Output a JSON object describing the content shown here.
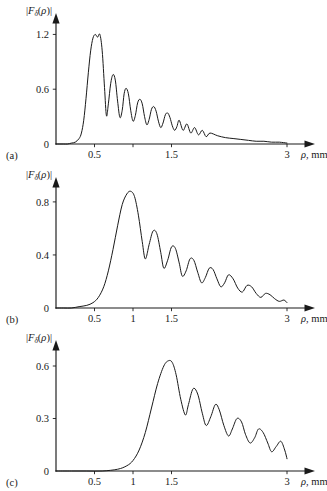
{
  "figure": {
    "background_color": "#ffffff",
    "line_color": "#1a1a1a",
    "panel_count": 3
  },
  "chart_data": [
    {
      "type": "line",
      "panel_tag": "(a)",
      "title": "",
      "ylabel": "|Fδ(ρ)|",
      "xlabel": "ρ, mm",
      "xlabel_symbol": "ρ",
      "xlabel_unit": ", mm",
      "ylabel_parts": {
        "bar_open": "|",
        "F": "F",
        "subscript": "δ",
        "arg_open": "(",
        "rho": "ρ",
        "arg_close": ")",
        "bar_close": "|"
      },
      "xlim": [
        0,
        3.25
      ],
      "ylim": [
        0,
        1.38
      ],
      "grid": false,
      "legend": "none",
      "xticks": [
        0.5,
        1,
        1.5,
        3
      ],
      "xtick_labels": [
        "0.5",
        "1.5",
        "3"
      ],
      "xtick_label_values": [
        0.5,
        1.5,
        3
      ],
      "yticks": [
        0,
        0.6,
        1.2
      ],
      "ytick_labels": [
        "0",
        "0.6",
        "1.2"
      ],
      "onset": 0.35,
      "main_peak_x": 0.57,
      "main_peak_y": 1.2,
      "oscillation_period": 0.115,
      "envelope_decay": 2.2,
      "x": [
        0.0,
        0.05,
        0.1,
        0.15,
        0.2,
        0.25,
        0.3,
        0.33,
        0.36,
        0.39,
        0.42,
        0.45,
        0.48,
        0.51,
        0.54,
        0.57,
        0.6,
        0.63,
        0.655,
        0.68,
        0.71,
        0.74,
        0.77,
        0.8,
        0.83,
        0.86,
        0.885,
        0.91,
        0.94,
        0.97,
        1.0,
        1.03,
        1.06,
        1.09,
        1.12,
        1.15,
        1.18,
        1.21,
        1.24,
        1.27,
        1.3,
        1.33,
        1.36,
        1.39,
        1.42,
        1.45,
        1.48,
        1.51,
        1.54,
        1.57,
        1.6,
        1.65,
        1.7,
        1.75,
        1.8,
        1.85,
        1.9,
        1.95,
        2.0,
        2.1,
        2.2,
        2.3,
        2.4,
        2.5,
        2.6,
        2.7,
        2.8,
        2.9,
        3.0
      ],
      "y": [
        0.0,
        0.0,
        0.0,
        0.0,
        0.01,
        0.02,
        0.06,
        0.12,
        0.26,
        0.5,
        0.78,
        1.02,
        1.16,
        1.2,
        1.17,
        1.2,
        1.02,
        0.62,
        0.31,
        0.44,
        0.66,
        0.76,
        0.7,
        0.47,
        0.29,
        0.37,
        0.55,
        0.61,
        0.55,
        0.37,
        0.25,
        0.31,
        0.45,
        0.49,
        0.44,
        0.3,
        0.21,
        0.27,
        0.38,
        0.41,
        0.36,
        0.25,
        0.18,
        0.23,
        0.32,
        0.34,
        0.29,
        0.2,
        0.15,
        0.19,
        0.26,
        0.15,
        0.22,
        0.12,
        0.18,
        0.1,
        0.15,
        0.08,
        0.12,
        0.09,
        0.07,
        0.06,
        0.05,
        0.04,
        0.03,
        0.03,
        0.02,
        0.02,
        0.01
      ]
    },
    {
      "type": "line",
      "panel_tag": "(b)",
      "title": "",
      "ylabel": "|Fδ(ρ)|",
      "xlabel": "ρ, mm",
      "xlabel_symbol": "ρ",
      "xlabel_unit": ", mm",
      "ylabel_parts": {
        "bar_open": "|",
        "F": "F",
        "subscript": "δ",
        "arg_open": "(",
        "rho": "ρ",
        "arg_close": ")",
        "bar_close": "|"
      },
      "xlim": [
        0,
        3.25
      ],
      "ylim": [
        0,
        0.95
      ],
      "grid": false,
      "legend": "none",
      "xticks": [
        0.5,
        1,
        1.5,
        3
      ],
      "xtick_labels": [
        "0.5",
        "1",
        "1.5",
        "3"
      ],
      "xtick_label_values": [
        0.5,
        1,
        1.5,
        3
      ],
      "yticks": [
        0,
        0.4,
        0.8
      ],
      "ytick_labels": [
        "0",
        "0.4",
        "0.8"
      ],
      "onset": 0.55,
      "main_peak_x": 0.97,
      "main_peak_y": 0.88,
      "oscillation_period": 0.15,
      "envelope_decay": 1.6,
      "x": [
        0.0,
        0.1,
        0.2,
        0.3,
        0.4,
        0.48,
        0.55,
        0.62,
        0.68,
        0.74,
        0.8,
        0.86,
        0.92,
        0.97,
        1.02,
        1.07,
        1.12,
        1.16,
        1.21,
        1.26,
        1.31,
        1.36,
        1.4,
        1.45,
        1.5,
        1.55,
        1.6,
        1.64,
        1.69,
        1.74,
        1.79,
        1.84,
        1.89,
        1.94,
        1.99,
        2.04,
        2.09,
        2.14,
        2.19,
        2.24,
        2.3,
        2.36,
        2.42,
        2.48,
        2.54,
        2.6,
        2.66,
        2.72,
        2.78,
        2.84,
        2.9,
        2.96,
        3.0
      ],
      "y": [
        0.0,
        0.0,
        0.0,
        0.01,
        0.02,
        0.04,
        0.08,
        0.16,
        0.28,
        0.44,
        0.62,
        0.78,
        0.86,
        0.88,
        0.84,
        0.7,
        0.5,
        0.37,
        0.48,
        0.58,
        0.56,
        0.42,
        0.3,
        0.36,
        0.46,
        0.45,
        0.34,
        0.24,
        0.28,
        0.37,
        0.36,
        0.27,
        0.19,
        0.23,
        0.3,
        0.29,
        0.22,
        0.16,
        0.19,
        0.25,
        0.22,
        0.15,
        0.12,
        0.17,
        0.16,
        0.11,
        0.08,
        0.11,
        0.1,
        0.07,
        0.05,
        0.06,
        0.04
      ]
    },
    {
      "type": "line",
      "panel_tag": "(c)",
      "title": "",
      "ylabel": "|Fδ(ρ)|",
      "xlabel": "ρ, mm",
      "xlabel_symbol": "ρ",
      "xlabel_unit": ", mm",
      "ylabel_parts": {
        "bar_open": "|",
        "F": "F",
        "subscript": "δ",
        "arg_open": "(",
        "rho": "ρ",
        "arg_close": ")",
        "bar_close": "|"
      },
      "xlim": [
        0,
        3.25
      ],
      "ylim": [
        0,
        0.72
      ],
      "grid": false,
      "legend": "none",
      "xticks": [
        0.5,
        1,
        1.5,
        3
      ],
      "xtick_labels": [
        "0.5",
        "1",
        "1.5",
        "3"
      ],
      "xtick_label_values": [
        0.5,
        1,
        1.5,
        3
      ],
      "yticks": [
        0,
        0.3,
        0.6
      ],
      "ytick_labels": [
        "0",
        "0.3",
        "0.6"
      ],
      "onset": 0.95,
      "main_peak_x": 1.5,
      "main_peak_y": 0.63,
      "oscillation_period": 0.16,
      "envelope_decay": 1.1,
      "x": [
        0.0,
        0.2,
        0.4,
        0.6,
        0.8,
        0.92,
        1.0,
        1.08,
        1.16,
        1.24,
        1.32,
        1.4,
        1.46,
        1.51,
        1.56,
        1.62,
        1.68,
        1.72,
        1.78,
        1.84,
        1.9,
        1.95,
        2.01,
        2.07,
        2.12,
        2.18,
        2.24,
        2.29,
        2.35,
        2.41,
        2.46,
        2.52,
        2.58,
        2.63,
        2.69,
        2.75,
        2.8,
        2.86,
        2.92,
        2.97,
        3.0
      ],
      "y": [
        0.0,
        0.0,
        0.0,
        0.0,
        0.01,
        0.03,
        0.06,
        0.12,
        0.22,
        0.36,
        0.5,
        0.6,
        0.63,
        0.62,
        0.55,
        0.41,
        0.32,
        0.38,
        0.47,
        0.44,
        0.33,
        0.26,
        0.31,
        0.38,
        0.35,
        0.26,
        0.2,
        0.24,
        0.3,
        0.28,
        0.21,
        0.16,
        0.19,
        0.24,
        0.22,
        0.16,
        0.11,
        0.14,
        0.17,
        0.12,
        0.07
      ]
    }
  ]
}
